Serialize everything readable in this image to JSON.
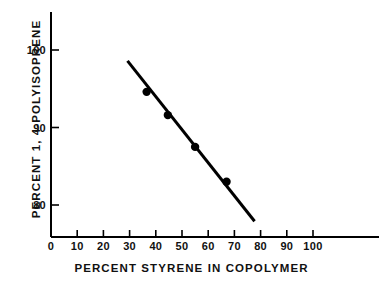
{
  "chart_data": {
    "type": "scatter",
    "title": "",
    "subtitle": "",
    "xlabel": "PERCENT STYRENE IN COPOLYMER",
    "ylabel": "PERCENT 1, 4-POLYISOPRENE",
    "xlim": [
      0,
      110
    ],
    "ylim": [
      75.5,
      102
    ],
    "xticks": [
      0,
      10,
      20,
      30,
      40,
      50,
      60,
      70,
      80,
      90,
      100
    ],
    "xtick_labels": [
      "0",
      "10",
      "20",
      "30",
      "40",
      "50",
      "60",
      "70",
      "80",
      "90",
      "100"
    ],
    "yticks": [
      80,
      90,
      100
    ],
    "ytick_labels": [
      "80",
      "90",
      "100"
    ],
    "grid": false,
    "legend": null,
    "marker": "filled-circle",
    "marker_color": "#000000",
    "line_color": "#000000",
    "axis_color": "#000000",
    "background": "#ffffff",
    "points": [
      {
        "x": 36.5,
        "y": 94.6
      },
      {
        "x": 44.6,
        "y": 91.6
      },
      {
        "x": 55.0,
        "y": 87.5
      },
      {
        "x": 67.0,
        "y": 83.0
      }
    ],
    "fit_line": {
      "label": "linear fit",
      "x_start": 29.2,
      "y_start": 98.6,
      "x_end": 77.7,
      "y_end": 77.9
    },
    "annotations": []
  },
  "axes": {
    "x_axis_name": "x-axis",
    "y_axis_name": "y-axis"
  }
}
